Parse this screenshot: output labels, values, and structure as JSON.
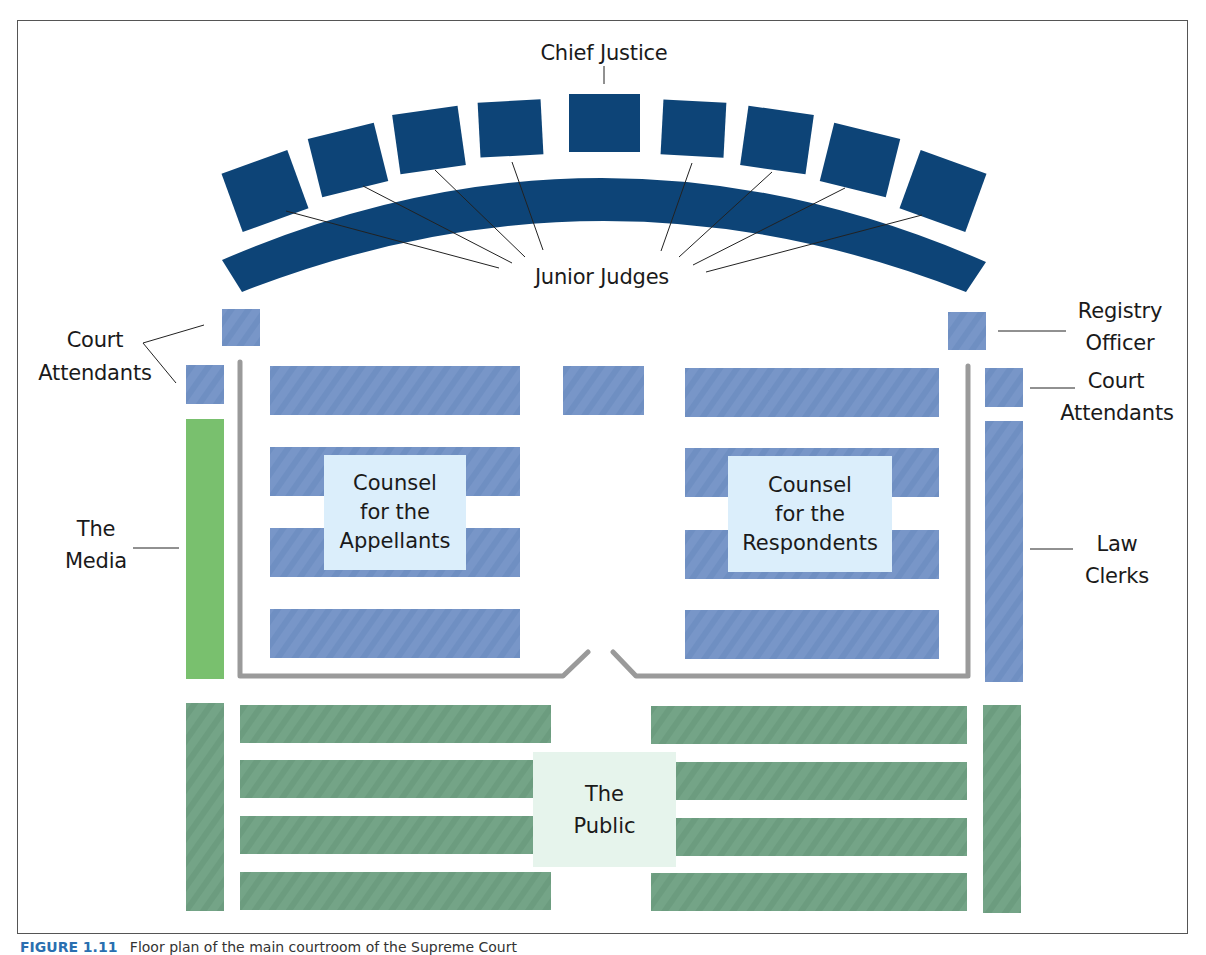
{
  "diagram": {
    "type": "courtroom-floor-plan",
    "colors": {
      "bench": "#0d4477",
      "counsel_seat": "#7896c8",
      "media": "#79c06e",
      "public_seat": "#74a487",
      "label_box_blue": "#dbeefb",
      "label_box_green": "#e6f4ec",
      "rail": "#9a9a9a",
      "frame": "#555555"
    },
    "labels": {
      "chief_justice": "Chief Justice",
      "junior_judges": "Junior Judges",
      "court_attendants_left_1": "Court",
      "court_attendants_left_2": "Attendants",
      "registry_officer_1": "Registry",
      "registry_officer_2": "Officer",
      "court_attendants_right_1": "Court",
      "court_attendants_right_2": "Attendants",
      "media_1": "The",
      "media_2": "Media",
      "law_clerks_1": "Law",
      "law_clerks_2": "Clerks",
      "appellants_1": "Counsel",
      "appellants_2": "for the",
      "appellants_3": "Appellants",
      "respondents_1": "Counsel",
      "respondents_2": "for the",
      "respondents_3": "Respondents",
      "public_1": "The",
      "public_2": "Public"
    },
    "judges": {
      "chief_count": 1,
      "junior_count": 8
    },
    "caption": {
      "figure": "FIGURE 1.11",
      "text": "Floor plan of the main courtroom of the Supreme Court"
    }
  }
}
